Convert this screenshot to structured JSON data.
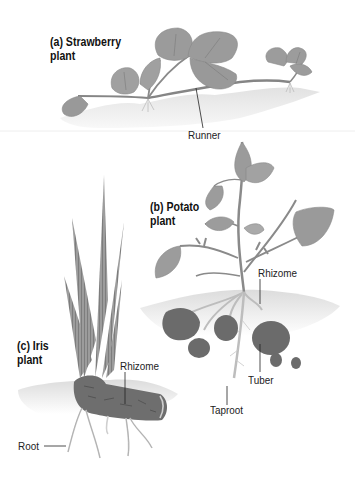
{
  "figure": {
    "panels": [
      {
        "id": "a",
        "title_line1": "(a) Strawberry",
        "title_line2": "plant",
        "labels": [
          "Runner"
        ]
      },
      {
        "id": "b",
        "title_line1": "(b) Potato",
        "title_line2": "plant",
        "labels": [
          "Rhizome",
          "Tuber",
          "Taproot"
        ]
      },
      {
        "id": "c",
        "title_line1": "(c) Iris",
        "title_line2": "plant",
        "labels": [
          "Rhizome",
          "Root"
        ]
      }
    ]
  },
  "colors": {
    "leaf": "#9a9a9a",
    "leaf_dark": "#7c7c7c",
    "stem": "#8e8e8e",
    "soil": "#e6e6e6",
    "tuber": "#6a6a6a",
    "root": "#b8b8b8",
    "label_line": "#222222"
  }
}
